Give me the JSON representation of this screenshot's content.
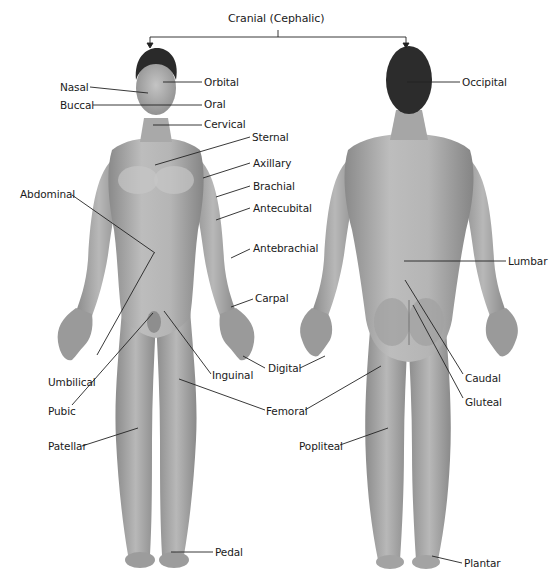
{
  "diagram": {
    "type": "anatomical-regions",
    "views": [
      "anterior",
      "posterior"
    ],
    "title": "Cranial (Cephalic)",
    "colors": {
      "skin_light": "#c9c9c9",
      "skin_mid": "#9e9e9e",
      "skin_dark": "#7a7a7a",
      "hair": "#2a2a2a",
      "line": "#222222",
      "text": "#1a1a1a"
    },
    "anterior_labels": {
      "nasal": "Nasal",
      "buccal": "Buccal",
      "orbital": "Orbital",
      "oral": "Oral",
      "cervical": "Cervical",
      "sternal": "Sternal",
      "axillary": "Axillary",
      "brachial": "Brachial",
      "antecubital": "Antecubital",
      "antebrachial": "Antebrachial",
      "carpal": "Carpal",
      "abdominal": "Abdominal",
      "umbilical": "Umbilical",
      "pubic": "Pubic",
      "inguinal": "Inguinal",
      "digital": "Digital",
      "femoral": "Femoral",
      "patellar": "Patellar",
      "pedal": "Pedal"
    },
    "posterior_labels": {
      "occipital": "Occipital",
      "lumbar": "Lumbar",
      "caudal": "Caudal",
      "gluteal": "Gluteal",
      "popliteal": "Popliteal",
      "plantar": "Plantar"
    }
  }
}
